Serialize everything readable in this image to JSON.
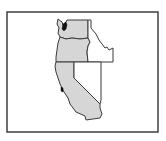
{
  "map": {
    "title": "Western United States",
    "frame": {
      "x": 7,
      "y": 12,
      "width": 151,
      "height": 120,
      "stroke": "#4a4a4a",
      "fill": "#ffffff"
    },
    "colors": {
      "highlight_fill": "#d6d6d6",
      "plain_fill": "#ffffff",
      "border": "#3a3a3a",
      "water_feature": "#111111"
    },
    "regions": [
      {
        "name": "Washington",
        "highlighted": true,
        "points": "58,19 62,22 63,25 66,22 67,20 88,20 88,38 80,39 72,38 66,39 60,37 58,33 59,28 57,24"
      },
      {
        "name": "Oregon",
        "highlighted": true,
        "points": "60,37 66,39 72,38 80,39 88,38 90,42 88,46 87,52 88,62 56,62 56,57 57,50 58,43"
      },
      {
        "name": "California",
        "highlighted": true,
        "points": "56,62 74,62 74,78 100,104 100,108 102,114 100,118 86,120 85,116 76,112 70,104 68,98 64,92 62,88 60,84 58,78 56,72 55,66"
      },
      {
        "name": "Idaho",
        "highlighted": false,
        "points": "88,20 91,20 91,28 96,34 99,40 102,44 105,48 107,47 109,50 113,48 113,62 88,62 87,52 88,46 90,42 88,38"
      },
      {
        "name": "Nevada",
        "highlighted": false,
        "points": "74,62 101,62 101,100 100,104 74,78"
      }
    ],
    "water_features": [
      {
        "name": "Puget Sound",
        "points": "63,24 66,22 67,25 66,29 64,31 62,29"
      },
      {
        "name": "San Francisco Bay",
        "points": "61,87 63,88 63,92 61,91"
      }
    ]
  }
}
